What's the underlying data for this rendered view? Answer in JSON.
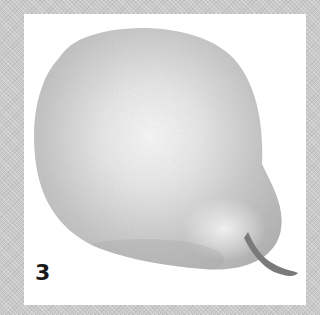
{
  "image": {
    "subject": "pear",
    "style": "grayscale watercolor illustration",
    "frame_color": "#c9c9c9",
    "background_color": "#ffffff"
  },
  "label": "3"
}
